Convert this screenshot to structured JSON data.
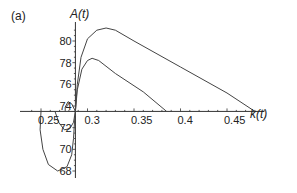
{
  "panel_label": "(a)",
  "chart_data": {
    "type": "line",
    "title": "",
    "panel": "(a)",
    "xlabel": "k(t)",
    "ylabel": "A(t)",
    "xlim": [
      0.24,
      0.49
    ],
    "ylim": [
      67.5,
      82
    ],
    "x_axis_crossing_y": 73.5,
    "y_axis_crossing_x": 0.287,
    "grid": false,
    "legend": null,
    "x_ticks": [
      {
        "value": 0.25,
        "label": "0.25"
      },
      {
        "value": 0.3,
        "label": "0.3"
      },
      {
        "value": 0.35,
        "label": "0.35"
      },
      {
        "value": 0.4,
        "label": "0.4"
      },
      {
        "value": 0.45,
        "label": "0.45"
      }
    ],
    "y_ticks": [
      {
        "value": 68,
        "label": "68"
      },
      {
        "value": 70,
        "label": "70"
      },
      {
        "value": 72,
        "label": "72"
      },
      {
        "value": 74,
        "label": "74"
      },
      {
        "value": 76,
        "label": "76"
      },
      {
        "value": 78,
        "label": "78"
      },
      {
        "value": 80,
        "label": "80"
      }
    ],
    "series": [
      {
        "name": "outer trajectory",
        "points": [
          [
            0.287,
            73.5
          ],
          [
            0.286,
            72.5
          ],
          [
            0.285,
            71
          ],
          [
            0.283,
            69.5
          ],
          [
            0.278,
            68.4
          ],
          [
            0.268,
            68.0
          ],
          [
            0.258,
            68.6
          ],
          [
            0.252,
            70.0
          ],
          [
            0.249,
            71.8
          ],
          [
            0.25,
            73.5
          ],
          [
            0.251,
            73.5
          ]
        ],
        "upper_branch": [
          [
            0.287,
            73.5
          ],
          [
            0.289,
            76
          ],
          [
            0.293,
            78.5
          ],
          [
            0.3,
            80.2
          ],
          [
            0.31,
            81.0
          ],
          [
            0.32,
            81.2
          ],
          [
            0.33,
            81.0
          ],
          [
            0.35,
            80.0
          ],
          [
            0.4,
            77.6
          ],
          [
            0.45,
            75.2
          ],
          [
            0.48,
            73.5
          ]
        ]
      },
      {
        "name": "inner trajectory",
        "points": [
          [
            0.287,
            73.5
          ],
          [
            0.285,
            72.5
          ],
          [
            0.281,
            71.9
          ],
          [
            0.275,
            71.8
          ],
          [
            0.269,
            72.5
          ],
          [
            0.265,
            73.5
          ]
        ],
        "upper_branch": [
          [
            0.287,
            73.5
          ],
          [
            0.289,
            75.5
          ],
          [
            0.294,
            77.4
          ],
          [
            0.3,
            78.2
          ],
          [
            0.305,
            78.4
          ],
          [
            0.312,
            78.2
          ],
          [
            0.33,
            77.0
          ],
          [
            0.36,
            75.3
          ],
          [
            0.385,
            73.5
          ]
        ]
      },
      {
        "name": "small loop near axis",
        "points": [
          [
            0.287,
            73.5
          ],
          [
            0.283,
            74.2
          ],
          [
            0.279,
            74.4
          ],
          [
            0.276,
            73.9
          ],
          [
            0.276,
            73.5
          ]
        ]
      }
    ]
  }
}
